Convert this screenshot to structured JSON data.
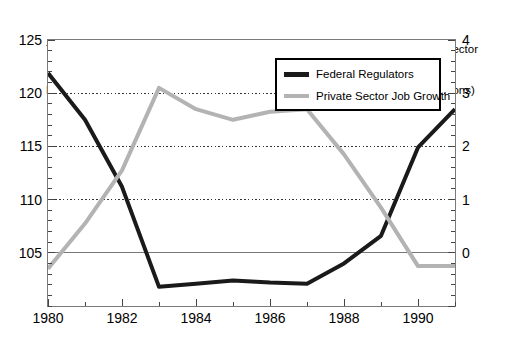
{
  "chart_data": {
    "type": "line",
    "title": "",
    "xlabel": "",
    "x": [
      1980,
      1981,
      1982,
      1983,
      1984,
      1985,
      1986,
      1987,
      1988,
      1989,
      1990,
      1991
    ],
    "xlim": [
      1980,
      1991
    ],
    "xticks": [
      1980,
      1982,
      1984,
      1986,
      1988,
      1990
    ],
    "xtick_labels": [
      "1980",
      "1982",
      "1984",
      "1986",
      "1988",
      "1990"
    ],
    "grid": true,
    "legend_position": "top-right",
    "left_axis": {
      "label": "Total Federal\nRegulators (Thousands)",
      "label_line1": "Total Federal",
      "label_line2": "Regulators (Thousands)",
      "ylim": [
        100,
        125
      ],
      "ticks": [
        105,
        110,
        115,
        120,
        125
      ],
      "tick_labels": [
        "105",
        "110",
        "115",
        "120",
        "125"
      ],
      "minor_tick_step": 1
    },
    "right_axis": {
      "label": "Annual Private Sector\nJob Growth (Millions)",
      "label_line1": "Annual Private Sector",
      "label_line2": "Job Growth (Millions)",
      "ylim": [
        -1,
        4
      ],
      "ticks": [
        0,
        1,
        2,
        3,
        4
      ],
      "tick_labels": [
        "0",
        "1",
        "2",
        "3",
        "4"
      ],
      "minor_tick_step": 0.2
    },
    "series": [
      {
        "name": "Federal Regulators",
        "axis": "left",
        "color": "#1a1a1a",
        "width": 4,
        "values": [
          121.9,
          117.5,
          111.2,
          101.8,
          102.1,
          102.4,
          102.2,
          102.1,
          104.0,
          106.6,
          114.9,
          118.5
        ]
      },
      {
        "name": "Private Sector Job Growth",
        "axis": "right",
        "color": "#b3b3b3",
        "width": 4,
        "values": [
          -0.3,
          0.55,
          1.55,
          3.1,
          2.7,
          2.5,
          2.65,
          2.7,
          1.85,
          0.85,
          -0.25,
          -0.25
        ]
      }
    ],
    "legend": {
      "entries": [
        {
          "label": "Federal Regulators",
          "color": "#1a1a1a"
        },
        {
          "label": "Private Sector Job Growth",
          "color": "#b3b3b3"
        }
      ]
    }
  }
}
